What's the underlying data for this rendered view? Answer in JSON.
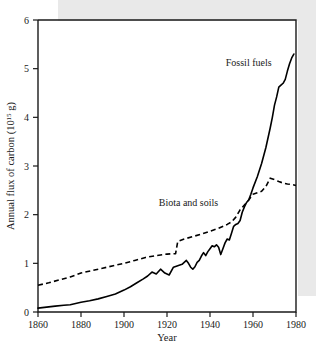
{
  "chart_data": {
    "type": "line",
    "title": "",
    "xlabel": "Year",
    "ylabel_plain": "Annual flux of carbon (1015 g)",
    "ylabel_main": "Annual flux of carbon (10",
    "ylabel_exponent": "15",
    "ylabel_tail": " g)",
    "xlim": [
      1860,
      1980
    ],
    "ylim": [
      0,
      6
    ],
    "xticks": [
      1860,
      1880,
      1900,
      1920,
      1940,
      1960,
      1980
    ],
    "xticklabels": [
      "1860",
      "1880",
      "1900",
      "1920",
      "1940",
      "1960",
      "1980"
    ],
    "yticks": [
      0,
      1,
      2,
      3,
      4,
      5,
      6
    ],
    "yticklabels": [
      "0",
      "1",
      "2",
      "3",
      "4",
      "5",
      "6"
    ],
    "grid": false,
    "legend_position": "inline-annotations",
    "annotations": [
      {
        "text": "Fossil fuels",
        "x": 1958,
        "y": 5.05,
        "series": "fossil-fuels"
      },
      {
        "text": "Biota and soils",
        "x": 1930,
        "y": 2.18,
        "series": "biota-and-soils"
      }
    ],
    "series": [
      {
        "name": "Fossil fuels",
        "style": "solid",
        "color": "#000000",
        "x": [
          1860,
          1864,
          1868,
          1872,
          1875,
          1878,
          1880,
          1884,
          1888,
          1892,
          1896,
          1900,
          1903,
          1906,
          1909,
          1911,
          1913,
          1915,
          1917,
          1919,
          1921,
          1923,
          1925,
          1927,
          1929,
          1930,
          1931,
          1932,
          1933,
          1934,
          1935,
          1936,
          1937,
          1938,
          1939,
          1940,
          1941,
          1942,
          1943,
          1944,
          1945,
          1946,
          1947,
          1948,
          1949,
          1950,
          1951,
          1952,
          1953,
          1954,
          1955,
          1956,
          1957,
          1958,
          1959,
          1960,
          1962,
          1964,
          1966,
          1968,
          1969,
          1970,
          1971,
          1972,
          1973,
          1974,
          1975,
          1976,
          1977,
          1978,
          1979
        ],
        "y": [
          0.08,
          0.1,
          0.12,
          0.14,
          0.15,
          0.18,
          0.2,
          0.23,
          0.27,
          0.32,
          0.37,
          0.45,
          0.52,
          0.6,
          0.68,
          0.74,
          0.82,
          0.78,
          0.88,
          0.8,
          0.76,
          0.92,
          0.95,
          0.98,
          1.06,
          1.0,
          0.92,
          0.88,
          0.93,
          1.02,
          1.06,
          1.15,
          1.22,
          1.16,
          1.24,
          1.3,
          1.36,
          1.34,
          1.38,
          1.33,
          1.18,
          1.3,
          1.42,
          1.5,
          1.48,
          1.62,
          1.76,
          1.8,
          1.82,
          1.88,
          2.05,
          2.16,
          2.25,
          2.3,
          2.42,
          2.55,
          2.78,
          3.05,
          3.38,
          3.78,
          4.0,
          4.25,
          4.42,
          4.62,
          4.66,
          4.7,
          4.78,
          4.95,
          5.1,
          5.22,
          5.3
        ]
      },
      {
        "name": "Biota and soils",
        "style": "dashed",
        "color": "#000000",
        "x": [
          1860,
          1865,
          1870,
          1875,
          1880,
          1885,
          1890,
          1895,
          1900,
          1905,
          1910,
          1915,
          1920,
          1924,
          1925,
          1928,
          1932,
          1936,
          1940,
          1944,
          1948,
          1950,
          1952,
          1954,
          1956,
          1958,
          1960,
          1962,
          1964,
          1966,
          1968,
          1970,
          1972,
          1974,
          1976,
          1978,
          1980
        ],
        "y": [
          0.55,
          0.6,
          0.66,
          0.72,
          0.8,
          0.85,
          0.9,
          0.95,
          1.0,
          1.06,
          1.12,
          1.16,
          1.19,
          1.2,
          1.45,
          1.5,
          1.55,
          1.6,
          1.66,
          1.72,
          1.8,
          1.85,
          1.95,
          2.1,
          2.2,
          2.3,
          2.42,
          2.45,
          2.48,
          2.58,
          2.75,
          2.72,
          2.68,
          2.65,
          2.63,
          2.62,
          2.6
        ]
      }
    ]
  }
}
